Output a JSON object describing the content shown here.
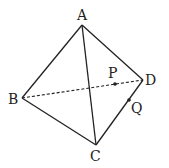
{
  "diagram": {
    "type": "tetrahedron",
    "stroke_color": "#222222",
    "vertices": {
      "A": {
        "label": "A",
        "x": 82,
        "y": 25
      },
      "B": {
        "label": "B",
        "x": 22,
        "y": 98
      },
      "C": {
        "label": "C",
        "x": 96,
        "y": 145
      },
      "D": {
        "label": "D",
        "x": 143,
        "y": 80
      }
    },
    "points": {
      "P": {
        "label": "P",
        "on_edge": "BD",
        "x": 115,
        "y": 84
      },
      "Q": {
        "label": "Q",
        "on_edge": "CD",
        "x": 129,
        "y": 100
      }
    },
    "edges": [
      {
        "from": "A",
        "to": "B",
        "style": "solid"
      },
      {
        "from": "A",
        "to": "C",
        "style": "solid"
      },
      {
        "from": "A",
        "to": "D",
        "style": "solid"
      },
      {
        "from": "B",
        "to": "C",
        "style": "solid"
      },
      {
        "from": "C",
        "to": "D",
        "style": "solid"
      },
      {
        "from": "B",
        "to": "D",
        "style": "dashed"
      }
    ]
  }
}
